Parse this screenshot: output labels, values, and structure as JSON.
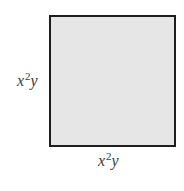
{
  "diagram": {
    "shape": "square",
    "fill_color": "#e6e6e6",
    "border_color": "#1e1e1e",
    "side_left": {
      "base": "x",
      "exponent": "2",
      "tail": "y"
    },
    "side_bottom": {
      "base": "x",
      "exponent": "2",
      "tail": "y"
    }
  }
}
